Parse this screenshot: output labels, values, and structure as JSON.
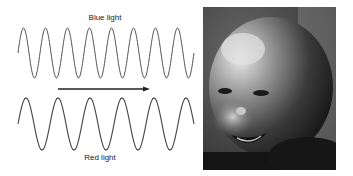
{
  "diagram": {
    "top_label": "Blue light",
    "bottom_label": "Red light",
    "wave_color": "#555555",
    "arrow_color": "#222222",
    "blue_wave": {
      "x_start": 18,
      "x_end": 194,
      "center_y": 53,
      "amplitude": 25,
      "period": 22
    },
    "red_wave": {
      "x_start": 18,
      "x_end": 194,
      "center_y": 124,
      "amplitude": 26,
      "period": 32
    },
    "arrow": {
      "x1": 58,
      "x2": 150,
      "y": 89
    }
  },
  "photo": {
    "subject": "Black-and-white photograph of a smiling baby"
  }
}
